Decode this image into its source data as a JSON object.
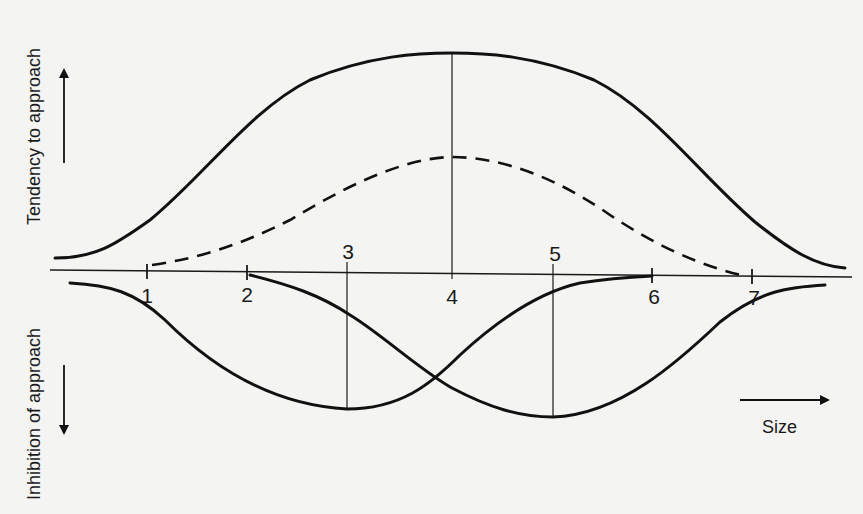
{
  "diagram": {
    "type": "approach-avoidance curves",
    "y_axis": {
      "upper_label": "Tendency to approach",
      "lower_label": "Inhibition of approach",
      "upper_arrow": "up",
      "lower_arrow": "down"
    },
    "x_axis": {
      "label": "Size",
      "arrow": "right",
      "tick_labels": [
        "1",
        "2",
        "3",
        "4",
        "5",
        "6",
        "7"
      ]
    },
    "curves": [
      {
        "name": "tendency-to-approach",
        "style": "solid",
        "side": "above axis",
        "span": "full width",
        "peak_at": "4"
      },
      {
        "name": "net-approach",
        "style": "dashed",
        "side": "above axis",
        "span": "1 to 7",
        "peak_at": "4"
      },
      {
        "name": "inhibition-curve-a",
        "style": "solid",
        "side": "below axis",
        "span": "left edge to 6",
        "trough_at": "3"
      },
      {
        "name": "inhibition-curve-b",
        "style": "solid",
        "side": "below axis",
        "span": "2 to right edge",
        "trough_at": "5"
      }
    ],
    "reference_lines": [
      "3",
      "4",
      "5"
    ],
    "colors": {
      "ink": "#111111",
      "paper": "#f4f4f2"
    }
  }
}
